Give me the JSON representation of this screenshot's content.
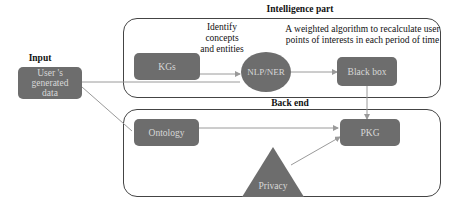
{
  "diagram": {
    "sections": {
      "input": {
        "title": "Input"
      },
      "intelligence": {
        "title": "Intelligence part"
      },
      "backend": {
        "title": "Back end"
      }
    },
    "nodes": {
      "user_data": {
        "label": "User 's generated data",
        "shape": "rounded-rect"
      },
      "kgs": {
        "label": "KGs",
        "shape": "rounded-rect"
      },
      "nlp_ner": {
        "label": "NLP/NER",
        "shape": "ellipse"
      },
      "black_box": {
        "label": "Black box",
        "shape": "rounded-rect"
      },
      "ontology": {
        "label": "Ontology",
        "shape": "rounded-rect"
      },
      "pkg": {
        "label": "PKG",
        "shape": "rounded-rect"
      },
      "privacy": {
        "label": "Privacy",
        "shape": "triangle"
      }
    },
    "annotations": {
      "identify": "Identify concepts and entities",
      "weighted": "A weighted algorithm to recalculate user points of interests in each period of time"
    },
    "edges": [
      {
        "from": "kgs",
        "to": "nlp_ner"
      },
      {
        "from": "user_data",
        "to": "nlp_ner"
      },
      {
        "from": "nlp_ner",
        "to": "black_box"
      },
      {
        "from": "black_box",
        "to": "pkg"
      },
      {
        "from": "user_data",
        "to": "ontology"
      },
      {
        "from": "ontology",
        "to": "pkg"
      },
      {
        "from": "privacy",
        "to": "pkg"
      }
    ],
    "colors": {
      "node_fill": "#6d6d6d",
      "node_text": "#d8d8d8",
      "edge": "#9a9a9a",
      "border": "#444444"
    }
  }
}
